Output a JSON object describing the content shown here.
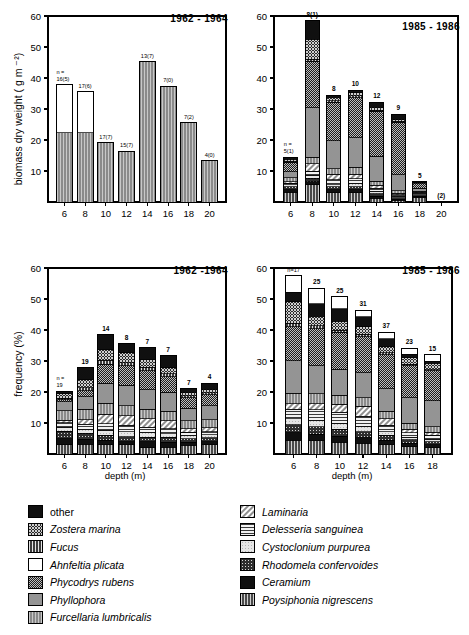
{
  "figure": {
    "axis_label_x": "depth  (m)",
    "axis_label_y_top": "biomass  dry weight  ( g m ⁻²)",
    "axis_label_y_bottom": "frequency  (%)"
  },
  "panels": [
    {
      "id": "biomass-1962-1964",
      "period": "1962 - 1964",
      "ylabel": "biomass  dry weight  ( g m ⁻²)",
      "xlabel": "",
      "n_prefix": "n =",
      "chart_data": {
        "type": "bar",
        "title": "1962 - 1964",
        "xlabel": "depth (m)",
        "ylabel": "biomass dry weight (g m-2)",
        "ylim": [
          0,
          60
        ],
        "yticks": [
          10,
          20,
          30,
          40,
          50,
          60
        ],
        "grid": false,
        "categories": [
          "6",
          "8",
          "10",
          "12",
          "14",
          "16",
          "18",
          "20"
        ],
        "values": [
          37.8,
          35.5,
          19.1,
          16.3,
          45.2,
          37.3,
          25.6,
          13.3
        ],
        "bar_labels": [
          "16(5)",
          "17(6)",
          "17(7)",
          "15(7)",
          "13(7)",
          "7(0)",
          "7(2)",
          "4(0)"
        ],
        "series": [
          {
            "name": "Furcellaria lumbricalis",
            "values": [
              22.4,
              22.3,
              19.1,
              16.3,
              45.2,
              37.3,
              25.6,
              13.3
            ]
          },
          {
            "name": "Ahnfeltia plicata",
            "values": [
              15.4,
              13.2,
              0,
              0,
              0,
              0,
              0,
              0
            ]
          }
        ]
      }
    },
    {
      "id": "biomass-1985-1986",
      "period": "1985 - 1986",
      "ylabel": "",
      "xlabel": "",
      "n_prefix": "n =",
      "chart_data": {
        "type": "bar",
        "title": "1985 - 1986",
        "xlabel": "depth (m)",
        "ylabel": "biomass dry weight (g m-2)",
        "ylim": [
          0,
          60
        ],
        "yticks": [
          10,
          20,
          30,
          40,
          50,
          60
        ],
        "grid": false,
        "categories": [
          "6",
          "8",
          "10",
          "12",
          "14",
          "16",
          "18",
          "20"
        ],
        "values": [
          14.5,
          58.5,
          34.5,
          36.0,
          32.2,
          28.3,
          6.6,
          0
        ],
        "bar_labels": [
          "5(1)",
          "8(1)",
          "8",
          "10",
          "12",
          "9",
          "5",
          "(2)"
        ],
        "stacked": true,
        "series": [
          {
            "name": "Poysiphonia nigrescens",
            "values": [
              3.2,
              5.5,
              3.0,
              3.0,
              1.2,
              0.5,
              1.4,
              0
            ]
          },
          {
            "name": "Ceramium",
            "values": [
              0.8,
              1.0,
              0.9,
              0.9,
              0.7,
              0.4,
              0.5,
              0
            ]
          },
          {
            "name": "Rhodomela confervoides",
            "values": [
              1.0,
              1.2,
              1.0,
              1.1,
              0.8,
              0.5,
              0.4,
              0
            ]
          },
          {
            "name": "Cystoclonium purpurea",
            "values": [
              0.6,
              0.9,
              0.7,
              0.9,
              0.7,
              0.4,
              0.3,
              0
            ]
          },
          {
            "name": "Delesseria sanguinea",
            "values": [
              0.5,
              1.4,
              1.6,
              1.6,
              1.0,
              0.6,
              0.3,
              0
            ]
          },
          {
            "name": "Laminaria",
            "values": [
              0.4,
              2.3,
              1.7,
              1.5,
              1.0,
              0.5,
              0.2,
              0
            ]
          },
          {
            "name": "Furcellaria lumbricalis",
            "values": [
              1.3,
              2.1,
              1.8,
              2.2,
              1.3,
              0.7,
              0.3,
              0
            ]
          },
          {
            "name": "Phyllophora",
            "values": [
              2.0,
              16.0,
              9.0,
              9.5,
              8.0,
              5.2,
              1.0,
              0
            ]
          },
          {
            "name": "Phycodrys rubens",
            "values": [
              3.0,
              15.0,
              12.5,
              13.0,
              14.5,
              17.0,
              1.8,
              0
            ]
          },
          {
            "name": "Fucus",
            "values": [
              0.4,
              0.6,
              0.5,
              0.5,
              0.4,
              0.2,
              0.1,
              0
            ]
          },
          {
            "name": "Zostera marina",
            "values": [
              0.6,
              6.5,
              1.1,
              1.1,
              1.0,
              0.7,
              0.2,
              0
            ]
          },
          {
            "name": "other",
            "values": [
              0.7,
              6.0,
              0.7,
              0.7,
              1.6,
              1.6,
              0.1,
              0
            ]
          }
        ]
      }
    },
    {
      "id": "frequency-1962-1964",
      "period": "1962 -1964",
      "ylabel": "frequency  (%)",
      "xlabel": "depth  (m)",
      "n_prefix": "n =",
      "chart_data": {
        "type": "bar",
        "title": "1962 -1964",
        "xlabel": "depth (m)",
        "ylabel": "frequency (%)",
        "ylim": [
          0,
          60
        ],
        "yticks": [
          10,
          20,
          30,
          40,
          50,
          60
        ],
        "grid": false,
        "categories": [
          "6",
          "8",
          "10",
          "12",
          "14",
          "16",
          "18",
          "20"
        ],
        "values": [
          20.3,
          27.8,
          38.4,
          35.5,
          34.2,
          31.7,
          21.0,
          22.9
        ],
        "bar_labels": [
          "19",
          "19",
          "14",
          "8",
          "7",
          "7",
          "7",
          "4"
        ],
        "stacked": true,
        "series": [
          {
            "name": "Poysiphonia nigrescens",
            "values": [
              3.0,
              3.2,
              3.0,
              3.0,
              2.0,
              2.2,
              2.8,
              3.0
            ]
          },
          {
            "name": "Ceramium",
            "values": [
              2.0,
              1.6,
              1.5,
              1.0,
              2.0,
              1.6,
              1.0,
              1.0
            ]
          },
          {
            "name": "Rhodomela confervoides",
            "values": [
              2.3,
              1.9,
              1.6,
              1.6,
              1.4,
              1.6,
              1.2,
              1.2
            ]
          },
          {
            "name": "Cystoclonium purpurea",
            "values": [
              1.4,
              1.3,
              1.6,
              1.6,
              1.4,
              1.2,
              1.0,
              1.0
            ]
          },
          {
            "name": "Delesseria sanguinea",
            "values": [
              1.4,
              1.6,
              2.0,
              2.0,
              1.8,
              1.6,
              1.0,
              1.0
            ]
          },
          {
            "name": "Laminaria",
            "values": [
              0.8,
              1.4,
              3.2,
              3.2,
              2.8,
              2.6,
              1.2,
              1.3
            ]
          },
          {
            "name": "Furcellaria lumbricalis",
            "values": [
              3.0,
              3.4,
              3.4,
              3.2,
              3.0,
              3.0,
              2.6,
              2.6
            ]
          },
          {
            "name": "Phyllophora",
            "values": [
              3.0,
              4.0,
              6.6,
              6.6,
              6.4,
              6.2,
              4.0,
              4.4
            ]
          },
          {
            "name": "Phycodrys rubens",
            "values": [
              0.6,
              2.0,
              6.0,
              6.2,
              6.1,
              4.9,
              3.4,
              3.6
            ]
          },
          {
            "name": "Fucus",
            "values": [
              0.5,
              1.0,
              1.3,
              1.1,
              1.1,
              1.0,
              0.6,
              0.6
            ]
          },
          {
            "name": "Zostera marina",
            "values": [
              1.4,
              2.6,
              3.4,
              3.2,
              2.4,
              2.0,
              1.2,
              1.2
            ]
          },
          {
            "name": "other",
            "values": [
              0.9,
              3.8,
              4.8,
              2.8,
              3.8,
              3.8,
              1.0,
              2.0
            ]
          }
        ]
      }
    },
    {
      "id": "frequency-1985-1986",
      "period": "1985 - 1986",
      "ylabel": "",
      "xlabel": "depth  (m)",
      "n_prefix": "n=",
      "chart_data": {
        "type": "bar",
        "title": "1985 - 1986",
        "xlabel": "depth (m)",
        "ylabel": "frequency (%)",
        "ylim": [
          0,
          60
        ],
        "yticks": [
          10,
          20,
          30,
          40,
          50,
          60
        ],
        "grid": false,
        "categories": [
          "6",
          "8",
          "10",
          "12",
          "14",
          "16",
          "18"
        ],
        "values": [
          57.5,
          53.4,
          50.8,
          46.3,
          39.2,
          34.1,
          32.0
        ],
        "bar_labels": [
          "n=17",
          "25",
          "25",
          "31",
          "37",
          "23",
          "15"
        ],
        "stacked": true,
        "series": [
          {
            "name": "Poysiphonia nigrescens",
            "values": [
              4.4,
              4.2,
              3.8,
              3.4,
              3.0,
              2.4,
              2.0
            ]
          },
          {
            "name": "Ceramium",
            "values": [
              2.4,
              2.2,
              2.0,
              1.8,
              1.4,
              1.0,
              1.0
            ]
          },
          {
            "name": "Rhodomela confervoides",
            "values": [
              2.6,
              2.4,
              2.2,
              2.0,
              1.6,
              1.2,
              1.0
            ]
          },
          {
            "name": "Cystoclonium purpurea",
            "values": [
              2.0,
              2.0,
              1.8,
              1.6,
              1.2,
              0.8,
              0.8
            ]
          },
          {
            "name": "Delesseria sanguinea",
            "values": [
              3.0,
              3.4,
              3.6,
              3.4,
              2.0,
              1.4,
              1.2
            ]
          },
          {
            "name": "Laminaria",
            "values": [
              1.8,
              2.0,
              2.6,
              3.2,
              2.2,
              1.2,
              1.0
            ]
          },
          {
            "name": "Furcellaria lumbricalis",
            "values": [
              3.4,
              3.2,
              3.0,
              2.8,
              2.4,
              2.0,
              1.8
            ]
          },
          {
            "name": "Phyllophora",
            "values": [
              10.5,
              9.0,
              8.4,
              8.0,
              7.2,
              8.2,
              8.4
            ]
          },
          {
            "name": "Phycodrys rubens",
            "values": [
              11.0,
              12.0,
              11.8,
              11.6,
              11.0,
              10.2,
              9.6
            ]
          },
          {
            "name": "Fucus",
            "values": [
              1.0,
              1.0,
              0.8,
              0.8,
              0.6,
              0.5,
              0.4
            ]
          },
          {
            "name": "Zostera marina",
            "values": [
              7.0,
              3.0,
              2.8,
              2.5,
              2.0,
              2.2,
              2.0
            ]
          },
          {
            "name": "other",
            "values": [
              3.0,
              4.0,
              4.0,
              3.2,
              2.6,
              1.0,
              0.8
            ]
          }
        ]
      }
    }
  ],
  "legend": {
    "left_column": [
      {
        "label": "other",
        "pattern": "solid-black",
        "italic": false
      },
      {
        "label": "Zostera marina",
        "pattern": "coarse-check",
        "italic": true
      },
      {
        "label": "Fucus",
        "pattern": "vertical-dense",
        "italic": true
      },
      {
        "label": "Ahnfeltia plicata",
        "pattern": "white",
        "italic": true
      },
      {
        "label": "Phycodrys rubens",
        "pattern": "fine-check",
        "italic": true
      },
      {
        "label": "Phyllophora",
        "pattern": "mid-grey",
        "italic": true
      },
      {
        "label": "Furcellaria lumbricalis",
        "pattern": "grey-vertical",
        "italic": true
      }
    ],
    "right_column": [
      {
        "label": "Laminaria",
        "pattern": "diagonal-hatch",
        "italic": true
      },
      {
        "label": "Delesseria  sanguinea",
        "pattern": "horizontal-lines",
        "italic": true
      },
      {
        "label": "Cystoclonium purpurea",
        "pattern": "light-dots",
        "italic": true
      },
      {
        "label": "Rhodomela confervoides",
        "pattern": "dot-grid",
        "italic": true
      },
      {
        "label": "Ceramium",
        "pattern": "solid-black",
        "italic": true
      },
      {
        "label": "Poysiphonia nigrescens",
        "pattern": "vertical-bars",
        "italic": true
      }
    ]
  }
}
